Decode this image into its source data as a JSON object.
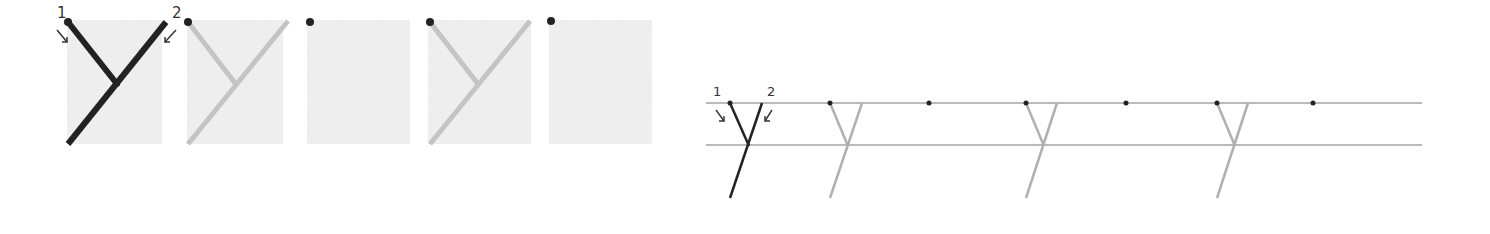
{
  "letter": "y",
  "left_panel": {
    "stroke_labels": [
      "1",
      "2"
    ],
    "boxes": [
      {
        "id": 1,
        "state": "demonstration",
        "stroke_color": "#222222"
      },
      {
        "id": 2,
        "state": "trace",
        "stroke_color": "#c4c4c4"
      },
      {
        "id": 3,
        "state": "blank",
        "stroke_color": null
      },
      {
        "id": 4,
        "state": "trace",
        "stroke_color": "#c4c4c4"
      },
      {
        "id": 5,
        "state": "blank",
        "stroke_color": null
      }
    ],
    "box_fill": "#ececec"
  },
  "right_panel": {
    "stroke_labels": [
      "1",
      "2"
    ],
    "guide_line_color": "#777777",
    "items": [
      {
        "type": "demonstration",
        "color": "#222222"
      },
      {
        "type": "trace",
        "color": "#b0b0b0"
      },
      {
        "type": "dot"
      },
      {
        "type": "trace",
        "color": "#b0b0b0"
      },
      {
        "type": "dot"
      },
      {
        "type": "trace",
        "color": "#b0b0b0"
      },
      {
        "type": "dot"
      }
    ]
  },
  "colors": {
    "dot": "#222222",
    "ink": "#222222",
    "trace": "#c0c0c0"
  }
}
